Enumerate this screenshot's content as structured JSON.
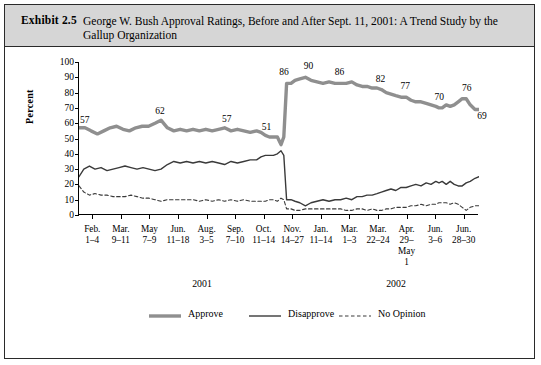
{
  "exhibit": {
    "label": "Exhibit 2.5",
    "title": "George W. Bush Approval Ratings, Before and After Sept. 11, 2001: A Trend Study by the Gallup Organization"
  },
  "chart_data": {
    "type": "line",
    "title": "George W. Bush Approval Ratings, Before and After Sept. 11, 2001: A Trend Study by the Gallup Organization",
    "xlabel": "",
    "ylabel": "Percent",
    "ylim": [
      0,
      100
    ],
    "yticks": [
      0,
      10,
      20,
      30,
      40,
      50,
      60,
      70,
      80,
      90,
      100
    ],
    "grid": false,
    "legend_position": "bottom-center",
    "axis_groups": [
      {
        "label": "2001",
        "x_fraction": 0.31
      },
      {
        "label": "2002",
        "x_fraction": 0.795
      }
    ],
    "categories": [
      "Feb.\n1–4",
      "Mar.\n9–11",
      "May\n7–9",
      "Jun.\n11–18",
      "Aug.\n3–5",
      "Sep.\n7–10",
      "Oct.\n11–14",
      "Nov.\n14–27",
      "Jan.\n11–14",
      "Mar.\n1–3",
      "Mar.\n22–24",
      "Apr.\n29–\nMay\n1",
      "Jun.\n3–6",
      "Jun.\n28–30"
    ],
    "annotations": [
      {
        "text": "57",
        "series": "Approve",
        "x": 0.022,
        "y": 57
      },
      {
        "text": "62",
        "series": "Approve",
        "x": 0.205,
        "y": 62
      },
      {
        "text": "57",
        "series": "Approve",
        "x": 0.372,
        "y": 57
      },
      {
        "text": "51",
        "series": "Approve",
        "x": 0.486,
        "y": 51
      },
      {
        "text": "86",
        "series": "Approve",
        "x": 0.525,
        "y": 86
      },
      {
        "text": "90",
        "series": "Approve",
        "x": 0.566,
        "y": 90
      },
      {
        "text": "86",
        "series": "Approve",
        "x": 0.654,
        "y": 86
      },
      {
        "text": "82",
        "series": "Approve",
        "x": 0.756,
        "y": 82
      },
      {
        "text": "77",
        "series": "Approve",
        "x": 0.818,
        "y": 77
      },
      {
        "text": "70",
        "series": "Approve",
        "x": 0.908,
        "y": 70
      },
      {
        "text": "76",
        "series": "Approve",
        "x": 0.962,
        "y": 76
      },
      {
        "text": "69",
        "series": "Approve",
        "x": 0.985,
        "y": 69
      }
    ],
    "series": [
      {
        "name": "Approve",
        "color": "#8f8f8f",
        "style": "solid-thick",
        "points": [
          [
            0.0,
            57
          ],
          [
            0.015,
            57
          ],
          [
            0.03,
            55
          ],
          [
            0.046,
            53
          ],
          [
            0.062,
            55
          ],
          [
            0.078,
            57
          ],
          [
            0.094,
            58
          ],
          [
            0.11,
            56
          ],
          [
            0.126,
            55
          ],
          [
            0.142,
            57
          ],
          [
            0.158,
            58
          ],
          [
            0.174,
            58
          ],
          [
            0.19,
            60
          ],
          [
            0.205,
            62
          ],
          [
            0.221,
            57
          ],
          [
            0.237,
            55
          ],
          [
            0.253,
            56
          ],
          [
            0.269,
            55
          ],
          [
            0.285,
            56
          ],
          [
            0.301,
            55
          ],
          [
            0.317,
            56
          ],
          [
            0.333,
            55
          ],
          [
            0.349,
            56
          ],
          [
            0.364,
            57
          ],
          [
            0.38,
            55
          ],
          [
            0.396,
            56
          ],
          [
            0.412,
            55
          ],
          [
            0.428,
            54
          ],
          [
            0.444,
            55
          ],
          [
            0.455,
            54
          ],
          [
            0.466,
            52
          ],
          [
            0.476,
            51
          ],
          [
            0.486,
            51
          ],
          [
            0.496,
            51
          ],
          [
            0.505,
            46
          ],
          [
            0.512,
            51
          ],
          [
            0.519,
            86
          ],
          [
            0.53,
            86
          ],
          [
            0.54,
            88
          ],
          [
            0.552,
            89
          ],
          [
            0.566,
            90
          ],
          [
            0.58,
            88
          ],
          [
            0.595,
            87
          ],
          [
            0.61,
            86
          ],
          [
            0.625,
            87
          ],
          [
            0.64,
            86
          ],
          [
            0.654,
            86
          ],
          [
            0.668,
            86
          ],
          [
            0.682,
            87
          ],
          [
            0.695,
            85
          ],
          [
            0.708,
            84
          ],
          [
            0.72,
            84
          ],
          [
            0.733,
            83
          ],
          [
            0.745,
            83
          ],
          [
            0.756,
            82
          ],
          [
            0.768,
            80
          ],
          [
            0.78,
            79
          ],
          [
            0.792,
            78
          ],
          [
            0.805,
            77
          ],
          [
            0.818,
            77
          ],
          [
            0.83,
            75
          ],
          [
            0.842,
            74
          ],
          [
            0.855,
            74
          ],
          [
            0.868,
            73
          ],
          [
            0.88,
            72
          ],
          [
            0.892,
            71
          ],
          [
            0.9,
            70
          ],
          [
            0.908,
            70
          ],
          [
            0.918,
            72
          ],
          [
            0.928,
            71
          ],
          [
            0.938,
            72
          ],
          [
            0.948,
            74
          ],
          [
            0.958,
            76
          ],
          [
            0.968,
            76
          ],
          [
            0.978,
            72
          ],
          [
            0.99,
            69
          ],
          [
            1.0,
            69
          ]
        ]
      },
      {
        "name": "Disapprove",
        "color": "#3a3a3a",
        "style": "solid-thin",
        "points": [
          [
            0.0,
            25
          ],
          [
            0.012,
            30
          ],
          [
            0.026,
            32
          ],
          [
            0.04,
            30
          ],
          [
            0.055,
            31
          ],
          [
            0.07,
            29
          ],
          [
            0.085,
            30
          ],
          [
            0.1,
            31
          ],
          [
            0.115,
            32
          ],
          [
            0.13,
            31
          ],
          [
            0.145,
            30
          ],
          [
            0.16,
            31
          ],
          [
            0.175,
            30
          ],
          [
            0.19,
            29
          ],
          [
            0.205,
            30
          ],
          [
            0.221,
            33
          ],
          [
            0.237,
            35
          ],
          [
            0.253,
            34
          ],
          [
            0.269,
            35
          ],
          [
            0.285,
            34
          ],
          [
            0.301,
            35
          ],
          [
            0.317,
            34
          ],
          [
            0.333,
            35
          ],
          [
            0.349,
            34
          ],
          [
            0.364,
            33
          ],
          [
            0.38,
            35
          ],
          [
            0.396,
            34
          ],
          [
            0.412,
            35
          ],
          [
            0.428,
            36
          ],
          [
            0.444,
            36
          ],
          [
            0.455,
            38
          ],
          [
            0.466,
            39
          ],
          [
            0.476,
            39
          ],
          [
            0.486,
            39
          ],
          [
            0.496,
            40
          ],
          [
            0.505,
            42
          ],
          [
            0.512,
            39
          ],
          [
            0.519,
            10
          ],
          [
            0.53,
            10
          ],
          [
            0.54,
            9
          ],
          [
            0.552,
            8
          ],
          [
            0.566,
            6
          ],
          [
            0.58,
            8
          ],
          [
            0.595,
            9
          ],
          [
            0.61,
            10
          ],
          [
            0.625,
            9
          ],
          [
            0.64,
            10
          ],
          [
            0.654,
            10
          ],
          [
            0.668,
            11
          ],
          [
            0.682,
            10
          ],
          [
            0.695,
            12
          ],
          [
            0.708,
            12
          ],
          [
            0.72,
            13
          ],
          [
            0.733,
            13
          ],
          [
            0.745,
            14
          ],
          [
            0.756,
            15
          ],
          [
            0.768,
            16
          ],
          [
            0.78,
            17
          ],
          [
            0.792,
            16
          ],
          [
            0.805,
            18
          ],
          [
            0.818,
            18
          ],
          [
            0.83,
            19
          ],
          [
            0.842,
            20
          ],
          [
            0.855,
            19
          ],
          [
            0.868,
            21
          ],
          [
            0.88,
            20
          ],
          [
            0.892,
            22
          ],
          [
            0.9,
            21
          ],
          [
            0.908,
            22
          ],
          [
            0.918,
            20
          ],
          [
            0.928,
            22
          ],
          [
            0.938,
            20
          ],
          [
            0.948,
            19
          ],
          [
            0.958,
            19
          ],
          [
            0.968,
            21
          ],
          [
            0.978,
            22
          ],
          [
            0.99,
            24
          ],
          [
            1.0,
            25
          ]
        ]
      },
      {
        "name": "No Opinion",
        "color": "#3a3a3a",
        "style": "dashed",
        "points": [
          [
            0.0,
            19
          ],
          [
            0.012,
            15
          ],
          [
            0.026,
            13
          ],
          [
            0.04,
            14
          ],
          [
            0.055,
            13
          ],
          [
            0.07,
            13
          ],
          [
            0.085,
            12
          ],
          [
            0.1,
            12
          ],
          [
            0.115,
            12
          ],
          [
            0.13,
            13
          ],
          [
            0.145,
            12
          ],
          [
            0.16,
            11
          ],
          [
            0.175,
            11
          ],
          [
            0.19,
            10
          ],
          [
            0.205,
            9
          ],
          [
            0.221,
            10
          ],
          [
            0.237,
            10
          ],
          [
            0.253,
            10
          ],
          [
            0.269,
            10
          ],
          [
            0.285,
            10
          ],
          [
            0.301,
            9
          ],
          [
            0.317,
            10
          ],
          [
            0.333,
            9
          ],
          [
            0.349,
            10
          ],
          [
            0.364,
            9
          ],
          [
            0.38,
            10
          ],
          [
            0.396,
            9
          ],
          [
            0.412,
            10
          ],
          [
            0.428,
            9
          ],
          [
            0.444,
            9
          ],
          [
            0.455,
            9
          ],
          [
            0.466,
            9
          ],
          [
            0.476,
            10
          ],
          [
            0.486,
            10
          ],
          [
            0.496,
            9
          ],
          [
            0.505,
            11
          ],
          [
            0.512,
            10
          ],
          [
            0.519,
            4
          ],
          [
            0.53,
            4
          ],
          [
            0.54,
            3
          ],
          [
            0.552,
            3
          ],
          [
            0.566,
            4
          ],
          [
            0.58,
            4
          ],
          [
            0.595,
            4
          ],
          [
            0.61,
            4
          ],
          [
            0.625,
            4
          ],
          [
            0.64,
            4
          ],
          [
            0.654,
            4
          ],
          [
            0.668,
            3
          ],
          [
            0.682,
            3
          ],
          [
            0.695,
            4
          ],
          [
            0.708,
            4
          ],
          [
            0.72,
            3
          ],
          [
            0.733,
            4
          ],
          [
            0.745,
            3
          ],
          [
            0.756,
            3
          ],
          [
            0.768,
            4
          ],
          [
            0.78,
            4
          ],
          [
            0.792,
            5
          ],
          [
            0.805,
            5
          ],
          [
            0.818,
            5
          ],
          [
            0.83,
            6
          ],
          [
            0.842,
            6
          ],
          [
            0.855,
            7
          ],
          [
            0.868,
            6
          ],
          [
            0.88,
            7
          ],
          [
            0.892,
            7
          ],
          [
            0.9,
            8
          ],
          [
            0.908,
            8
          ],
          [
            0.918,
            8
          ],
          [
            0.928,
            7
          ],
          [
            0.938,
            8
          ],
          [
            0.948,
            7
          ],
          [
            0.958,
            5
          ],
          [
            0.968,
            3
          ],
          [
            0.978,
            5
          ],
          [
            0.99,
            6
          ],
          [
            1.0,
            6
          ]
        ]
      }
    ],
    "legend": [
      {
        "label": "Approve",
        "color": "#8f8f8f",
        "style": "solid-thick"
      },
      {
        "label": "Disapprove",
        "color": "#3a3a3a",
        "style": "solid-thin"
      },
      {
        "label": "No Opinion",
        "color": "#3a3a3a",
        "style": "dashed"
      }
    ]
  }
}
